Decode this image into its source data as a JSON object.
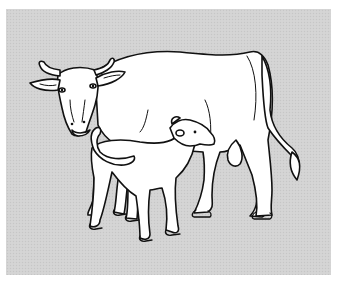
{
  "illustration": {
    "subject": "cow nursing calf",
    "style": "black line drawing on gray halftone background",
    "colors": {
      "background": "#ffffff",
      "panel": "#d3d3d3",
      "outline": "#111111",
      "fill": "#ffffff"
    },
    "figures": [
      "cow",
      "calf"
    ]
  }
}
